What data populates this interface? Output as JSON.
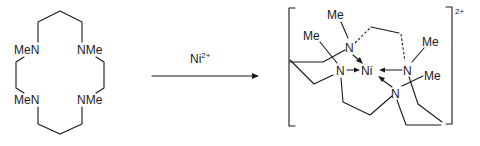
{
  "scheme": {
    "reactant": {
      "name": "tetramethyl macrocyclic tetraamine",
      "labels": {
        "top_left": "MeN",
        "top_right": "NMe",
        "bottom_left": "MeN",
        "bottom_right": "NMe"
      }
    },
    "reagent": {
      "symbol": "Ni",
      "charge": "2+"
    },
    "product": {
      "name": "nickel(II) macrocycle complex",
      "labels": {
        "metal": "Ni",
        "n_top": "N",
        "n_left": "N",
        "n_right": "N",
        "n_bottom": "N",
        "me_top": "Me",
        "me_left": "Me",
        "me_right": "Me",
        "me_bottom": "Me"
      },
      "charge": "2+"
    }
  }
}
